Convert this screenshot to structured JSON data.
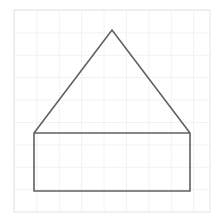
{
  "figure": {
    "background_color": "#ffffff",
    "canvas": {
      "width": 223,
      "height": 223
    }
  },
  "grid": {
    "name": "graph-paper-grid",
    "line_color": "#e6e6e8",
    "line_width": 1,
    "origin_x": 14,
    "origin_y": 10,
    "cell_size": 22.4,
    "columns": 9,
    "rows": 9,
    "right_edge": 210,
    "bottom_edge": 212
  },
  "shape": {
    "name": "house-pentagon",
    "type": "polygon",
    "stroke_color": "#5f5f63",
    "stroke_width": 1.6,
    "fill": "none",
    "vertices": [
      {
        "label": "rect-bottom-left",
        "x": 34,
        "y": 191
      },
      {
        "label": "rect-bottom-right",
        "x": 190,
        "y": 191
      },
      {
        "label": "eave-right",
        "x": 190,
        "y": 133
      },
      {
        "label": "roof-apex",
        "x": 112,
        "y": 30
      },
      {
        "label": "eave-left",
        "x": 34,
        "y": 133
      }
    ],
    "interior_line": {
      "label": "eave-line",
      "x1": 34,
      "y1": 133,
      "x2": 190,
      "y2": 133
    },
    "parts": [
      {
        "label": "rectangle-base",
        "width": 156,
        "height": 58
      },
      {
        "label": "triangle-roof",
        "base": 156,
        "height": 103
      }
    ]
  }
}
